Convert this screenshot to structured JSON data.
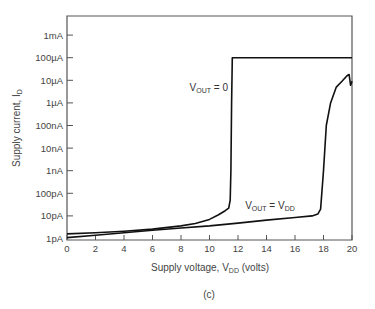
{
  "chart_data": {
    "type": "line",
    "title": "",
    "caption": "(c)",
    "xlabel": {
      "main": "Supply voltage, V",
      "sub": "DD",
      "suffix": " (volts)"
    },
    "ylabel": {
      "main": "Supply current, I",
      "sub": "D"
    },
    "x_range": [
      0,
      20
    ],
    "y_scale": "log",
    "y_range_amps": [
      1e-12,
      0.01
    ],
    "x_ticks": [
      0,
      2,
      4,
      6,
      8,
      10,
      12,
      14,
      16,
      18,
      20
    ],
    "y_ticks": [
      {
        "value": 1e-12,
        "label": "1pA"
      },
      {
        "value": 1e-11,
        "label": "10pA"
      },
      {
        "value": 1e-10,
        "label": "100pA"
      },
      {
        "value": 1e-09,
        "label": "1nA"
      },
      {
        "value": 1e-08,
        "label": "10nA"
      },
      {
        "value": 1e-07,
        "label": "100nA"
      },
      {
        "value": 1e-06,
        "label": "1µA"
      },
      {
        "value": 1e-05,
        "label": "10µA"
      },
      {
        "value": 0.0001,
        "label": "100µA"
      },
      {
        "value": 0.001,
        "label": "1mA"
      }
    ],
    "grid": false,
    "series": [
      {
        "name": "V_OUT = 0",
        "label_main": "V",
        "label_sub": "OUT",
        "label_rest": " = 0",
        "points": [
          [
            0,
            1.6e-12
          ],
          [
            2,
            1.8e-12
          ],
          [
            4,
            2.1e-12
          ],
          [
            6,
            2.6e-12
          ],
          [
            8,
            3.6e-12
          ],
          [
            9,
            4.6e-12
          ],
          [
            10,
            7e-12
          ],
          [
            10.6,
            1.1e-11
          ],
          [
            11.1,
            1.7e-11
          ],
          [
            11.35,
            2.2e-11
          ],
          [
            11.45,
            5e-11
          ],
          [
            11.5,
            1e-09
          ],
          [
            11.55,
            1e-06
          ],
          [
            11.6,
            0.0001
          ],
          [
            20,
            0.0001
          ]
        ]
      },
      {
        "name": "V_OUT = V_DD",
        "label_main": "V",
        "label_sub": "OUT",
        "label_rest": " = V",
        "label_sub2": "DD",
        "points": [
          [
            0,
            1.1e-12
          ],
          [
            2,
            1.4e-12
          ],
          [
            4,
            1.8e-12
          ],
          [
            6,
            2.3e-12
          ],
          [
            8,
            2.9e-12
          ],
          [
            10,
            3.6e-12
          ],
          [
            12,
            4.8e-12
          ],
          [
            14,
            6.5e-12
          ],
          [
            16,
            8.5e-12
          ],
          [
            17.2,
            1e-11
          ],
          [
            17.6,
            1.2e-11
          ],
          [
            17.8,
            2e-11
          ],
          [
            18,
            1e-09
          ],
          [
            18.2,
            1e-07
          ],
          [
            18.5,
            1e-06
          ],
          [
            18.9,
            5e-06
          ],
          [
            19.3,
            9e-06
          ],
          [
            19.65,
            1.6e-05
          ],
          [
            19.8,
            1.8e-05
          ],
          [
            19.9,
            6e-06
          ],
          [
            20,
            9e-06
          ]
        ]
      }
    ],
    "annotations": [
      {
        "series": 0,
        "x": 8.6,
        "y": 3.2e-06
      },
      {
        "series": 1,
        "x": 12.5,
        "y": 2e-11
      }
    ]
  }
}
